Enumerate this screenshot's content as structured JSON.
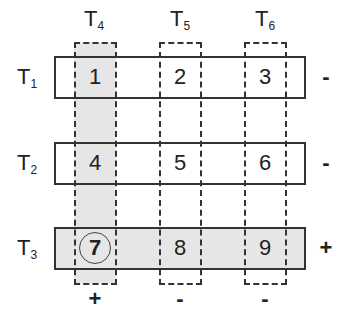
{
  "diagram": {
    "rows": [
      {
        "id": "T1",
        "base": "T",
        "sub": "1",
        "sign": "-",
        "highlighted": false,
        "cells": [
          "1",
          "2",
          "3"
        ]
      },
      {
        "id": "T2",
        "base": "T",
        "sub": "2",
        "sign": "-",
        "highlighted": false,
        "cells": [
          "4",
          "5",
          "6"
        ]
      },
      {
        "id": "T3",
        "base": "T",
        "sub": "3",
        "sign": "+",
        "highlighted": true,
        "cells": [
          "7",
          "8",
          "9"
        ]
      }
    ],
    "columns": [
      {
        "id": "T4",
        "base": "T",
        "sub": "4",
        "sign": "+",
        "highlighted": true
      },
      {
        "id": "T5",
        "base": "T",
        "sub": "5",
        "sign": "-",
        "highlighted": false
      },
      {
        "id": "T6",
        "base": "T",
        "sub": "6",
        "sign": "-",
        "highlighted": false
      }
    ],
    "circled_cell": "7",
    "colors": {
      "shade": "#e6e6e6",
      "line": "#333333",
      "background": "#ffffff"
    }
  }
}
